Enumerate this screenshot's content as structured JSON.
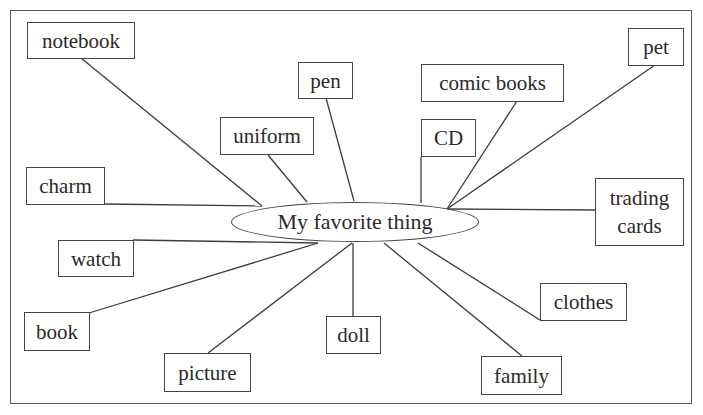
{
  "diagram": {
    "type": "mind-map",
    "center": {
      "label": "My favorite thing"
    },
    "nodes": [
      {
        "id": "notebook",
        "label": "notebook"
      },
      {
        "id": "pen",
        "label": "pen"
      },
      {
        "id": "uniform",
        "label": "uniform"
      },
      {
        "id": "comic-books",
        "label": "comic books"
      },
      {
        "id": "cd",
        "label": "CD"
      },
      {
        "id": "pet",
        "label": "pet"
      },
      {
        "id": "charm",
        "label": "charm"
      },
      {
        "id": "trading-cards",
        "label_line1": "trading",
        "label_line2": "cards"
      },
      {
        "id": "watch",
        "label": "watch"
      },
      {
        "id": "book",
        "label": "book"
      },
      {
        "id": "picture",
        "label": "picture"
      },
      {
        "id": "doll",
        "label": "doll"
      },
      {
        "id": "clothes",
        "label": "clothes"
      },
      {
        "id": "family",
        "label": "family"
      }
    ],
    "colors": {
      "line": "#3c3c3c",
      "border": "#444444",
      "text": "#2a2a2a",
      "background": "#ffffff"
    }
  }
}
